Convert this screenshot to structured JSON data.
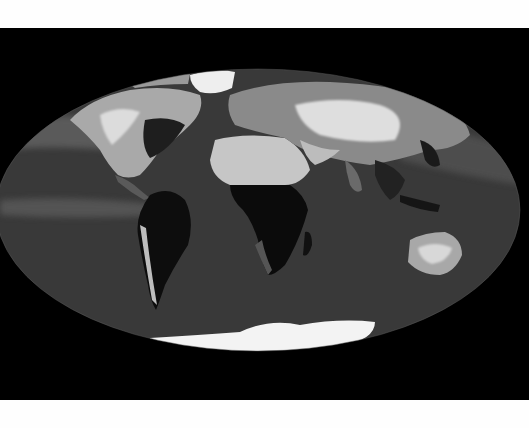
{
  "image": {
    "subject": "Global greyscale map in an elliptical (Mollweide-style) projection",
    "background_color": "#000000",
    "frame_color": "#fefefe",
    "ocean_color": "#3a3a3a",
    "ice_color": "#f4f4f4",
    "bright_land_color": "#c8c8c8",
    "dark_land_color": "#0c0c0c"
  },
  "regions": [
    {
      "name": "North America",
      "tone": "light-grey"
    },
    {
      "name": "South America",
      "tone": "very-dark"
    },
    {
      "name": "Africa (Sahara)",
      "tone": "light-grey"
    },
    {
      "name": "Africa (Central/South)",
      "tone": "very-dark"
    },
    {
      "name": "Eurasia",
      "tone": "light-grey"
    },
    {
      "name": "Australia",
      "tone": "light-grey"
    },
    {
      "name": "Antarctica",
      "tone": "white"
    },
    {
      "name": "Greenland",
      "tone": "white"
    }
  ]
}
